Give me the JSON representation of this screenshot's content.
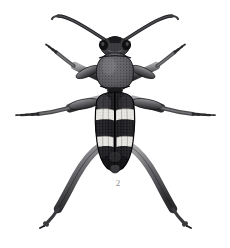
{
  "plate": {
    "kind": "scientific-illustration",
    "subject": "longhorn-beetle-dorsal-view",
    "figure_label": "2",
    "background_color": "#ffffff",
    "label_color": "#8e8e8e",
    "width": 230,
    "height": 248
  },
  "palette": {
    "ink_black": "#18181a",
    "elytra_dark": "#232326",
    "elytra_mid": "#3c3c40",
    "pronotum_gray": "#5d5d61",
    "pronotum_light": "#78787c",
    "band_pale": "#e8e6e2",
    "band_shadow": "#b9b7b3",
    "leg_gray": "#575759",
    "leg_light": "#8c8c8f",
    "stipple": "#0e0e10",
    "outline": "#101012"
  },
  "anatomy": {
    "head": {
      "name": "head",
      "center_x": 115,
      "center_y": 45,
      "width": 26,
      "height": 18,
      "color": "#2a2a2d"
    },
    "eyes": {
      "name": "compound-eyes",
      "left_x": 104,
      "right_x": 126,
      "y": 44,
      "color": "#131315"
    },
    "pronotum": {
      "name": "pronotum",
      "center_x": 115,
      "center_y": 72,
      "width": 34,
      "height": 38,
      "color": "#5d5d61",
      "texture": "dense-stipple"
    },
    "scutellum": {
      "name": "scutellum",
      "center_x": 115,
      "center_y": 92,
      "color": "#1a1a1c"
    },
    "elytra": {
      "name": "elytra",
      "top_y": 92,
      "bottom_y": 168,
      "left_x": 97,
      "right_x": 134,
      "color": "#232326",
      "suture_x": 115,
      "bands": [
        {
          "name": "upper-pale-band",
          "y": 112,
          "height": 9,
          "color": "#e8e6e2"
        },
        {
          "name": "lower-pale-band",
          "y": 139,
          "height": 9,
          "color": "#e8e6e2"
        }
      ]
    },
    "abdomen_tip": {
      "name": "abdomen-apex",
      "center_x": 115,
      "center_y": 166,
      "color": "#2b2b2e"
    }
  },
  "appendages": {
    "antennae": [
      {
        "name": "antenna-left",
        "side": "left",
        "tip_x": 59,
        "tip_y": 17
      },
      {
        "name": "antenna-right",
        "side": "right",
        "tip_x": 172,
        "tip_y": 17
      }
    ],
    "legs": [
      {
        "name": "foreleg-left",
        "side": "left",
        "pair": "fore",
        "tip_x": 52,
        "tip_y": 48
      },
      {
        "name": "foreleg-right",
        "side": "right",
        "pair": "fore",
        "tip_x": 178,
        "tip_y": 48
      },
      {
        "name": "midleg-left",
        "side": "left",
        "pair": "mid",
        "tip_x": 15,
        "tip_y": 114
      },
      {
        "name": "midleg-right",
        "side": "right",
        "pair": "mid",
        "tip_x": 215,
        "tip_y": 114
      },
      {
        "name": "hindleg-left",
        "side": "left",
        "pair": "hind",
        "tip_x": 43,
        "tip_y": 228
      },
      {
        "name": "hindleg-right",
        "side": "right",
        "pair": "hind",
        "tip_x": 188,
        "tip_y": 228
      }
    ]
  }
}
